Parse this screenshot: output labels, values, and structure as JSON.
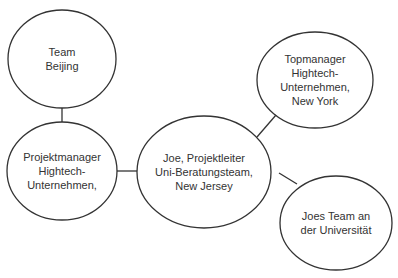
{
  "diagram": {
    "type": "network",
    "stroke_color": "#333333",
    "background": "#ffffff",
    "nodes": [
      {
        "id": "beijing",
        "label": "Team\nBeijing",
        "cx": 62,
        "cy": 59,
        "rx": 54,
        "ry": 49
      },
      {
        "id": "projektmanager",
        "label": "Projektmanager\nHightech-\nUnternehmen,",
        "cx": 62,
        "cy": 171,
        "rx": 55,
        "ry": 49
      },
      {
        "id": "joe",
        "label": "Joe, Projektleiter\nUni-Beratungsteam,\nNew Jersey",
        "cx": 204,
        "cy": 172,
        "rx": 67,
        "ry": 56
      },
      {
        "id": "topmanager",
        "label": "Topmanager\nHightech-\nUnternehmen,\nNew York",
        "cx": 315,
        "cy": 80,
        "rx": 58,
        "ry": 48
      },
      {
        "id": "joes_team",
        "label": "Joes Team an\nder Universität",
        "cx": 336,
        "cy": 223,
        "rx": 56,
        "ry": 47
      }
    ],
    "edges": [
      {
        "from": "beijing",
        "to": "projektmanager"
      },
      {
        "from": "projektmanager",
        "to": "joe"
      },
      {
        "from": "joe",
        "to": "topmanager"
      },
      {
        "from": "joe",
        "to": "joes_team"
      }
    ]
  }
}
